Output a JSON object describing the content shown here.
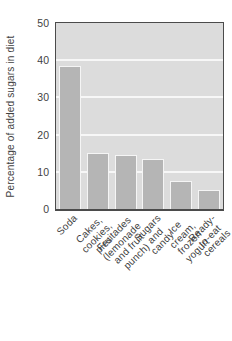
{
  "figure": {
    "background": "#ffffff",
    "colors": {
      "plot_bg": "#dcdcdc",
      "bar_fill": "#b5b5b5",
      "bar_outline": "#f5f5f5",
      "gridline": "#f7f7f7",
      "frame": "#4b4b4b",
      "text": "#3f3f3f"
    }
  },
  "chart_data": {
    "type": "bar",
    "title": "",
    "xlabel": "",
    "ylabel": "Percentage of added sugars in diet",
    "categories": [
      "Soda",
      "Cakes, cookies, pies",
      "Fruitades (lemonade\nand fruit punch)",
      "Sugars and candy",
      "Ice cream, frozen yogurt",
      "Ready-to-eat cereals"
    ],
    "values": [
      38.5,
      15,
      14.5,
      13.5,
      7.5,
      5
    ],
    "ylim": [
      0,
      50
    ],
    "yticks": [
      0,
      10,
      20,
      30,
      40,
      50
    ],
    "grid": "horizontal",
    "legend": "none"
  }
}
